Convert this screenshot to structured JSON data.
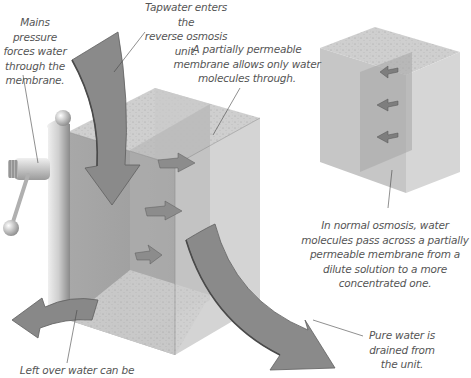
{
  "title": "Reverse osmosis unit",
  "labels": {
    "mains_pressure": "Mains pressure forces water through the membrane.",
    "mains_pressure_lines": [
      "Mains pressure",
      "forces water",
      "through the",
      "membrane."
    ],
    "tapwater": "Tapwater enters the reverse osmosis unit.",
    "tapwater_lines": [
      "Tapwater enters the",
      "reverse osmosis unit."
    ],
    "membrane": "A partially permeable membrane allows only water molecules through.",
    "membrane_lines": [
      "A partially permeable",
      "membrane allows only water",
      "molecules through."
    ],
    "normal_osmosis": "In normal osmosis, water molecules pass across a partially permeable membrane from a dilute solution to a more concentrated one.",
    "normal_osmosis_lines": [
      "In normal osmosis, water",
      "molecules pass across a partially",
      "permeable membrane from a",
      "dilute solution to a more",
      "concentrated one."
    ],
    "pure_water": "Pure water is drained from the unit.",
    "pure_water_lines": [
      "Pure water is",
      "drained from",
      "the unit."
    ],
    "left_over": "Left over water can be",
    "left_over_lines": [
      "Left over water can be"
    ]
  },
  "colors": {
    "box_light": "#d6d6d6",
    "box_mid": "#bdbdbd",
    "box_dark": "#9a9a9a",
    "arrow": "#7a7a7a",
    "text": "#555555",
    "leader_line": "#444444"
  },
  "icons": {
    "tap_valve": "valve-handle-icon",
    "inflow_arrow": "curved-arrow-down-icon",
    "outflow_arrow": "curved-arrow-right-icon",
    "waste_arrow": "curved-arrow-left-icon",
    "molecule_arrow": "small-arrow-icon"
  }
}
